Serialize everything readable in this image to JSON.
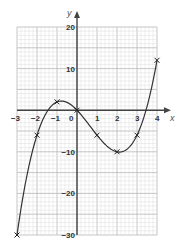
{
  "chart_data": {
    "type": "line",
    "title": "",
    "xlabel": "x",
    "ylabel": "y",
    "xlim": [
      -3,
      4
    ],
    "ylim": [
      -30,
      20
    ],
    "grid": true,
    "x_ticks": [
      "-3",
      "-2",
      "-1",
      "0",
      "1",
      "2",
      "3",
      "4"
    ],
    "y_ticks": [
      "20",
      "10",
      "-10",
      "-20",
      "-30"
    ],
    "series": [
      {
        "name": "curve",
        "x": [
          -3,
          -2,
          -1,
          0,
          1,
          2,
          3,
          4
        ],
        "y": [
          -30,
          -6,
          2,
          0,
          -6,
          -10,
          -6,
          12
        ],
        "marker": "x"
      }
    ],
    "colors": {
      "curve": "#333333",
      "axis": "#444444",
      "grid_major": "#b8b8b8",
      "grid_minor": "#dcdcdc"
    }
  }
}
